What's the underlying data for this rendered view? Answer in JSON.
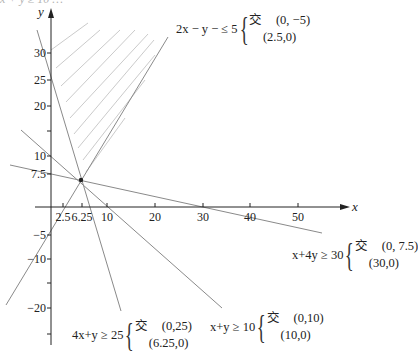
{
  "header_fragment": "x + y ≥ 10 …",
  "axes": {
    "x_label": "x",
    "y_label": "y",
    "x_ticks": [
      {
        "value": 2.5,
        "label": "2.5",
        "px": 63
      },
      {
        "value": 6.25,
        "label": "6.25",
        "px": 82
      },
      {
        "value": 10,
        "label": "10",
        "px": 107
      },
      {
        "value": 20,
        "label": "20",
        "px": 155
      },
      {
        "value": 30,
        "label": "30",
        "px": 203
      },
      {
        "value": 40,
        "label": "40",
        "px": 250
      },
      {
        "value": 50,
        "label": "50",
        "px": 298
      }
    ],
    "y_ticks": [
      {
        "value": 30,
        "label": "30",
        "py": 53
      },
      {
        "value": 25,
        "label": "25",
        "py": 80
      },
      {
        "value": 20,
        "label": "20",
        "py": 106
      },
      {
        "value": 15,
        "label": "",
        "py": 131
      },
      {
        "value": 10,
        "label": "10",
        "py": 156
      },
      {
        "value": 7.5,
        "label": "7.5",
        "py": 174
      },
      {
        "value": -5,
        "label": "−5",
        "py": 235
      },
      {
        "value": -10,
        "label": "−10",
        "py": 259
      },
      {
        "value": -15,
        "label": "",
        "py": 283
      },
      {
        "value": -20,
        "label": "−20",
        "py": 308
      },
      {
        "value": -25,
        "label": "",
        "py": 334
      }
    ]
  },
  "constraints": [
    {
      "id": "c1",
      "inequality": "2x − y − ≤ 5",
      "intercept_label": "交",
      "points": [
        "(0, −5)",
        "(2.5,0)"
      ]
    },
    {
      "id": "c2",
      "inequality": "x+4y ≥ 30",
      "intercept_label": "交",
      "points": [
        "(0, 7.5)",
        "(30,0)"
      ]
    },
    {
      "id": "c3",
      "inequality": "x+y ≥ 10",
      "intercept_label": "交",
      "points": [
        "(0,10)",
        "(10,0)"
      ]
    },
    {
      "id": "c4",
      "inequality": "4x+y ≥ 25",
      "intercept_label": "交",
      "points": [
        "(0,25)",
        "(6.25,0)"
      ]
    }
  ],
  "feasible_region": {
    "style": "hatched",
    "color": "#bdbdbd"
  },
  "colors": {
    "line": "#8a8a8a",
    "axis": "#222222",
    "hatch": "#c4c4c4"
  }
}
